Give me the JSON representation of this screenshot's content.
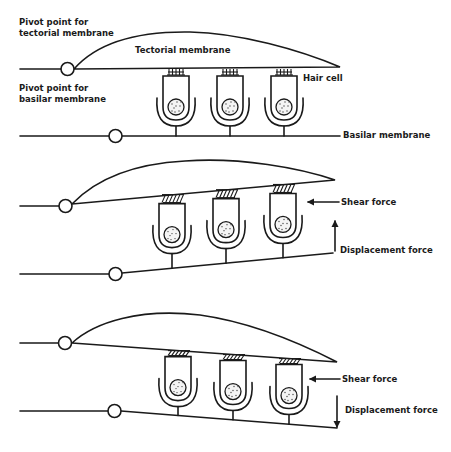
{
  "figure": {
    "panels": [
      {
        "state": "rest",
        "labels": {
          "tectorial_pivot": [
            "Pivot point for",
            "tectorial membrane"
          ],
          "basilar_pivot": [
            "Pivot point for",
            "basilar membrane"
          ],
          "tectorial_membrane": "Tectorial membrane",
          "hair_cell": "Hair cell",
          "basilar_membrane": "Basilar membrane"
        },
        "hair_cell_count": 3
      },
      {
        "state": "upward displacement",
        "labels": {
          "shear_force": "Shear force",
          "displacement_force": "Displacement force"
        },
        "displacement_direction": "up",
        "shear_direction": "left",
        "hair_cell_count": 3
      },
      {
        "state": "downward displacement",
        "labels": {
          "shear_force": "Shear force",
          "displacement_force": "Displacement force"
        },
        "displacement_direction": "down",
        "shear_direction": "left",
        "hair_cell_count": 3
      }
    ],
    "colors": {
      "ink": "#1a1a1a",
      "background": "#ffffff"
    }
  }
}
